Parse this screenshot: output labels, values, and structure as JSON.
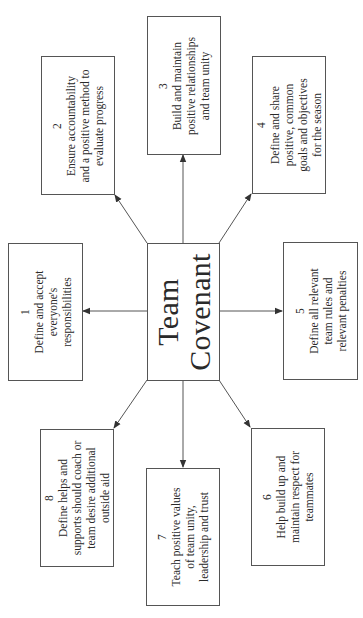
{
  "diagram": {
    "title_lines": [
      "Team",
      "Covenant"
    ],
    "line_color": "#555555",
    "nodes": [
      {
        "number": "1",
        "lines": [
          "Define and accept",
          "everyone's",
          "responsibilities"
        ]
      },
      {
        "number": "2",
        "lines": [
          "Ensure accountability",
          "and a positive method to",
          "evaluate progress"
        ]
      },
      {
        "number": "3",
        "lines": [
          "Build and maintain",
          "positive relationships",
          "and team unity"
        ]
      },
      {
        "number": "4",
        "lines": [
          "Define and share",
          "positive, common",
          "goals and objectives",
          "for the season"
        ]
      },
      {
        "number": "5",
        "lines": [
          "Define all relevant",
          "team rules and",
          "relevant penalties"
        ]
      },
      {
        "number": "6",
        "lines": [
          "Help build up and",
          "maintain respect for",
          "teammates"
        ]
      },
      {
        "number": "7",
        "lines": [
          "Teach positive values",
          "of team unity,",
          "leadership and trust"
        ]
      },
      {
        "number": "8",
        "lines": [
          "Define helps and",
          "supports should coach or",
          "team desire additional",
          "outside aid"
        ]
      }
    ]
  }
}
